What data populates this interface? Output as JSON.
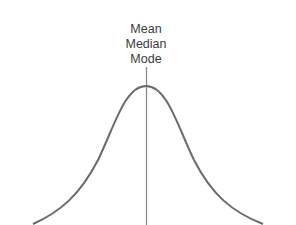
{
  "diagram": {
    "labels": [
      "Mean",
      "Median",
      "Mode"
    ],
    "colors": {
      "curve": "#6b6b6b",
      "axis_line": "#8a8a8a",
      "text": "#3a3a3a",
      "background": "#ffffff"
    }
  }
}
